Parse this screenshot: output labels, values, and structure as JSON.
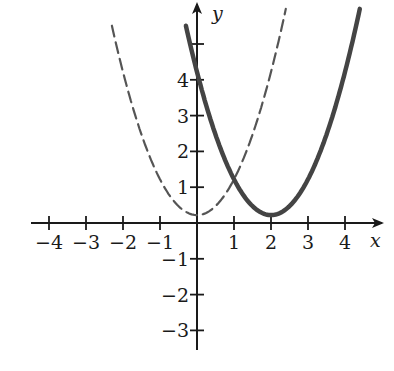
{
  "chart_data": {
    "type": "line",
    "title": "",
    "xlabel": "x",
    "ylabel": "y",
    "xlim": [
      -4.5,
      4.9
    ],
    "ylim": [
      -3.5,
      5.6
    ],
    "grid": false,
    "legend": null,
    "x_ticks": [
      -4,
      -3,
      -2,
      -1,
      1,
      2,
      3,
      4
    ],
    "x_tick_labels": [
      "−4",
      "−3",
      "−2",
      "−1",
      "1",
      "2",
      "3",
      "4"
    ],
    "y_ticks": [
      -3,
      -2,
      -1,
      1,
      2,
      3,
      4,
      5
    ],
    "y_tick_labels": [
      "−3",
      "−2",
      "−1",
      "1",
      "2",
      "3",
      "4",
      ""
    ],
    "series": [
      {
        "name": "y = x^2",
        "style": "dashed",
        "color": "#555555",
        "x_range": [
          -2.3,
          2.4
        ],
        "function": "x^2",
        "vertex": [
          0,
          0
        ]
      },
      {
        "name": "y = (x - 2)^2",
        "style": "solid",
        "color": "#444444",
        "x_range": [
          -0.3,
          4.4
        ],
        "function": "(x-2)^2",
        "vertex": [
          2,
          0
        ]
      }
    ]
  },
  "axes": {
    "x_label": "x",
    "y_label": "y"
  }
}
